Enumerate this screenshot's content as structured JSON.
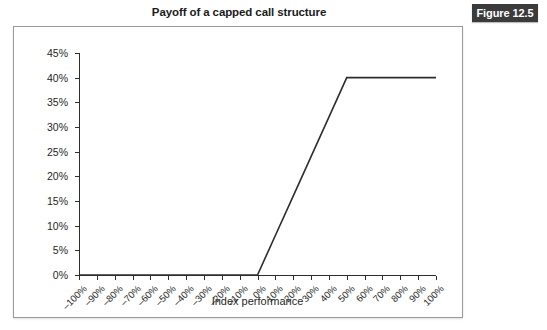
{
  "figure": {
    "title": "Payoff of a capped call structure",
    "badge_label": "Figure 12.5",
    "badge_color": "#3b3b3b",
    "panel_border_color": "#9a9a9a",
    "background_color": "#ffffff"
  },
  "chart_data": {
    "type": "line",
    "title": "Payoff of a capped call structure",
    "xlabel": "Index performance",
    "ylabel": "Procuct payoff",
    "xlim": [
      -100,
      100
    ],
    "ylim": [
      0,
      45
    ],
    "grid": false,
    "legend": null,
    "line_color": "#2d2d2d",
    "x_tick_labels": [
      "–100%",
      "–90%",
      "–80%",
      "–70%",
      "–60%",
      "–50%",
      "–40%",
      "–30%",
      "–20%",
      "–10%",
      "0%",
      "10%",
      "20%",
      "30%",
      "40%",
      "50%",
      "60%",
      "70%",
      "80%",
      "90%",
      "100%"
    ],
    "x_tick_values": [
      -100,
      -90,
      -80,
      -70,
      -60,
      -50,
      -40,
      -30,
      -20,
      -10,
      0,
      10,
      20,
      30,
      40,
      50,
      60,
      70,
      80,
      90,
      100
    ],
    "y_tick_labels": [
      "0%",
      "5%",
      "10%",
      "15%",
      "20%",
      "25%",
      "30%",
      "35%",
      "40%",
      "45%"
    ],
    "y_tick_values": [
      0,
      5,
      10,
      15,
      20,
      25,
      30,
      35,
      40,
      45
    ],
    "series": [
      {
        "name": "Capped call payoff",
        "x": [
          -100,
          -90,
          -80,
          -70,
          -60,
          -50,
          -40,
          -30,
          -20,
          -10,
          0,
          10,
          20,
          30,
          40,
          50,
          60,
          70,
          80,
          90,
          100
        ],
        "values": [
          0,
          0,
          0,
          0,
          0,
          0,
          0,
          0,
          0,
          0,
          0,
          8,
          16,
          24,
          32,
          40,
          40,
          40,
          40,
          40,
          40
        ]
      }
    ],
    "annotations": {
      "strike": 0,
      "cap_level": 50,
      "cap_payoff": 40
    }
  }
}
